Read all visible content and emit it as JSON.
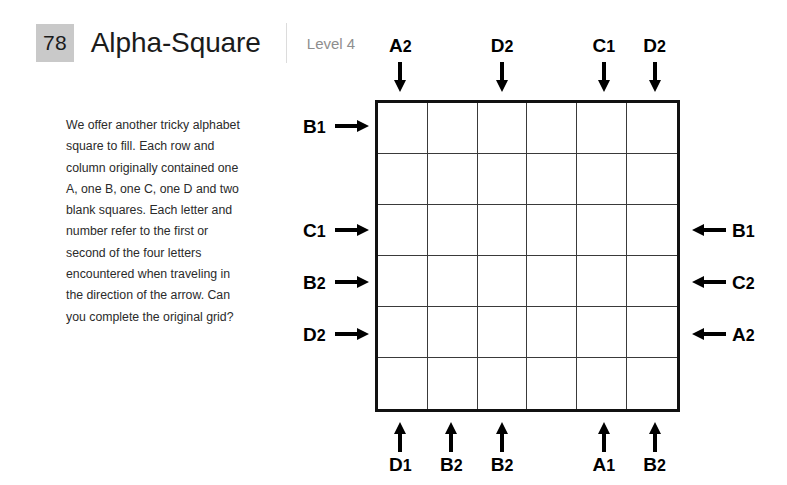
{
  "header": {
    "number": "78",
    "title": "Alpha-Square",
    "level": "Level 4"
  },
  "instructions": {
    "text": "We offer another tricky alphabet square to fill. Each row and column originally contained one A, one B, one C, one D and two blank squares. Each letter and number refer to the first or second of the four letters encountered when traveling in the direction of the arrow. Can you complete the original grid?"
  },
  "grid": {
    "rows": 6,
    "columns": 6,
    "cells": [
      [
        "",
        "",
        "",
        "",
        "",
        ""
      ],
      [
        "",
        "",
        "",
        "",
        "",
        ""
      ],
      [
        "",
        "",
        "",
        "",
        "",
        ""
      ],
      [
        "",
        "",
        "",
        "",
        "",
        ""
      ],
      [
        "",
        "",
        "",
        "",
        "",
        ""
      ],
      [
        "",
        "",
        "",
        "",
        "",
        ""
      ]
    ]
  },
  "clues": {
    "top": [
      "A2",
      "",
      "D2",
      "",
      "C1",
      "D2"
    ],
    "bottom": [
      "D1",
      "B2",
      "B2",
      "",
      "A1",
      "B2"
    ],
    "left": [
      "B1",
      "",
      "C1",
      "B2",
      "D2",
      ""
    ],
    "right": [
      "",
      "",
      "B1",
      "C2",
      "A2",
      ""
    ]
  },
  "icons": {
    "arrow_down": "arrow-down-icon",
    "arrow_up": "arrow-up-icon",
    "arrow_right": "arrow-right-icon",
    "arrow_left": "arrow-left-icon"
  },
  "colors": {
    "number_badge_bg": "#c9c9c9",
    "title_text": "#1b1b1b",
    "level_text": "#8e8e8e",
    "body_text": "#2b2b2b",
    "grid_border": "#111111",
    "grid_line": "#3a3a3a"
  }
}
